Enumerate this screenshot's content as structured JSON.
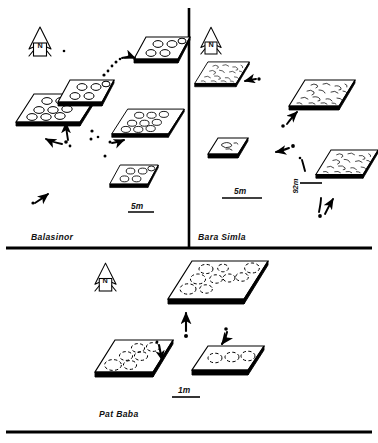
{
  "figure": {
    "type": "site-map",
    "background_color": "#ffffff",
    "ink_color": "#000000",
    "panels": [
      {
        "id": "balasinor",
        "label": "Balasinor",
        "north_arrow_label": "N",
        "scale_bar_label": "5m",
        "platform_count": 6,
        "platform_content": "eggs"
      },
      {
        "id": "bara-simla",
        "label": "Bara Simla",
        "north_arrow_label": "N",
        "scale_bar_label": "5m",
        "distance_label": "92m",
        "platform_count": 5,
        "platform_content": "eggshell-fragments"
      },
      {
        "id": "pat-baba",
        "label": "Pat Baba",
        "north_arrow_label": "N",
        "scale_bar_label": "1m",
        "platform_count": 3,
        "platform_content": "eggs"
      }
    ],
    "icons": {
      "north_arrow": "north-arrow-icon",
      "scale_bar": "scale-bar-icon",
      "platform": "nest-platform-icon",
      "egg": "egg-circle-icon",
      "fragment": "eggshell-fragment-icon",
      "connector": "curved-arrow-icon",
      "dot": "locator-dot-icon"
    }
  }
}
